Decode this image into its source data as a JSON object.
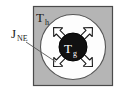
{
  "figure": {
    "title": "",
    "caption": "",
    "background_color": "#ffffff"
  },
  "labels": {
    "host_temperature": {
      "base": "T",
      "subscript": "h",
      "full": "Th",
      "color": "#1a1a1a"
    },
    "grain_temperature": {
      "base": "T",
      "subscript": "g",
      "full": "Tg",
      "color": "#ffffff"
    },
    "flux": {
      "base": "J",
      "subscript": "NE",
      "full": "JNE",
      "color": "#1a1a1a"
    }
  },
  "shapes": {
    "outer_square": {
      "name": "host-region",
      "fill": "#b5b5b5",
      "stroke": "#4a4a4a",
      "x": 33,
      "y": 6,
      "width": 80,
      "height": 80
    },
    "outer_circle": {
      "name": "shell-region",
      "fill": "#fdfdfd",
      "stroke": "#555555",
      "cx": 73,
      "cy": 47,
      "r": 33
    },
    "inner_circle": {
      "name": "grain-core",
      "fill": "#111111",
      "stroke": "#000000",
      "cx": 73,
      "cy": 47,
      "r": 14
    }
  },
  "arrows": {
    "count": 4,
    "style": "hollow-outline",
    "fill": "#ffffff",
    "stroke": "#1a1a1a",
    "directions": [
      "northwest",
      "northeast",
      "southwest",
      "southeast"
    ]
  },
  "leader_line": {
    "name": "flux-leader-line",
    "stroke": "#555555",
    "from_x": 26,
    "from_y": 42,
    "to_x": 55,
    "to_y": 61
  }
}
